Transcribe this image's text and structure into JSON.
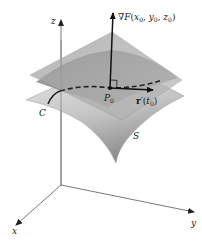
{
  "diagram": {
    "type": "gradient-normal-to-level-surface",
    "labels": {
      "z_axis": "z",
      "x_axis": "x",
      "y_axis": "y",
      "gradient": "∇F(x₀, y₀, z₀)",
      "gradient_parts": {
        "nabla": "∇",
        "F": "F",
        "open": "(",
        "x": "x",
        "x_sub": "0",
        "y": "y",
        "y_sub": "0",
        "z": "z",
        "z_sub": "0",
        "close": ")",
        "comma": ", "
      },
      "point": "P₀",
      "point_parts": {
        "P": "P",
        "sub": "0"
      },
      "tangent_vector": "r′(t₀)",
      "tangent_parts": {
        "r": "r",
        "prime": "′",
        "open": "(",
        "t": "t",
        "sub": "0",
        "close": ")"
      },
      "curve": "C",
      "surface": "S"
    },
    "colors": {
      "axis": "#555555",
      "arrow": "#111111",
      "plane_fill": "#9a9a9a",
      "surface_light": "#d2d2d2",
      "surface_dark": "#8f8f8f",
      "curve": "#222222"
    }
  }
}
